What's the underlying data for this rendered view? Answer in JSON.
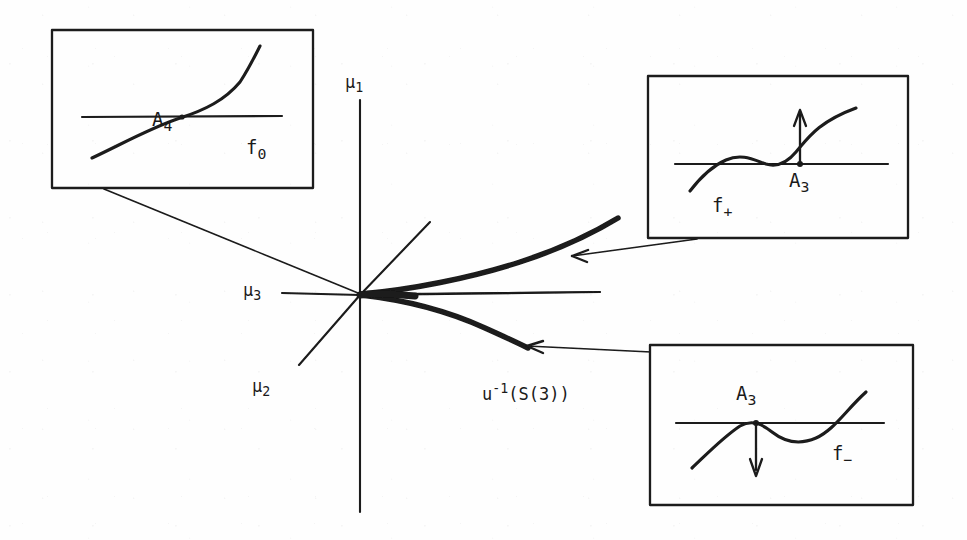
{
  "figure": {
    "kind": "bifurcation-diagram",
    "background_color": "#fefefe",
    "ink_color": "#1a1a1a"
  },
  "axes": {
    "origin": {
      "x": 360,
      "y": 295
    },
    "mu1": {
      "label_text": "μ",
      "label_sub": "1",
      "label_x": 348,
      "label_y": 78,
      "description": "vertical axis pointing up"
    },
    "mu2": {
      "label_text": "μ",
      "label_sub": "2",
      "label_x": 258,
      "label_y": 382,
      "description": "diagonal axis toward lower-left"
    },
    "mu3": {
      "label_text": "μ",
      "label_sub": "3",
      "label_x": 248,
      "label_y": 286,
      "description": "horizontal axis pointing left"
    }
  },
  "curve_label": {
    "base": "u",
    "exponent": "-1",
    "argument": "(S(3))",
    "full_text": "u⁻¹(S(3))",
    "x": 486,
    "y": 388
  },
  "insets": [
    {
      "name": "f-zero-inset",
      "label_text": "f",
      "label_sub": "0",
      "point_label_text": "A",
      "point_label_sub": "4",
      "box": {
        "x": 52,
        "y": 30,
        "w": 261,
        "h": 158
      },
      "label_pos": {
        "x": 250,
        "y": 145
      },
      "point_label_pos": {
        "x": 160,
        "y": 118
      },
      "curve_shape": "monotone-increasing-inflection",
      "arrow": "none"
    },
    {
      "name": "f-plus-inset",
      "label_text": "f",
      "label_sub": "+",
      "point_label_text": "A",
      "point_label_sub": "3",
      "box": {
        "x": 648,
        "y": 76,
        "w": 260,
        "h": 162
      },
      "label_pos": {
        "x": 718,
        "y": 200
      },
      "point_label_pos": {
        "x": 795,
        "y": 170
      },
      "curve_shape": "local-max-then-tangent-touch",
      "arrow": "up"
    },
    {
      "name": "f-minus-inset",
      "label_text": "f",
      "label_sub": "−",
      "point_label_text": "A",
      "point_label_sub": "3",
      "box": {
        "x": 650,
        "y": 345,
        "w": 263,
        "h": 160
      },
      "label_pos": {
        "x": 838,
        "y": 452
      },
      "point_label_pos": {
        "x": 742,
        "y": 408
      },
      "curve_shape": "tangent-touch-then-local-min",
      "arrow": "down"
    }
  ],
  "leaders": [
    {
      "name": "leader-f-zero",
      "from": {
        "x": 104,
        "y": 189
      },
      "to": {
        "x": 358,
        "y": 293
      }
    },
    {
      "name": "leader-f-plus",
      "from": {
        "x": 697,
        "y": 239
      },
      "to": {
        "x": 572,
        "y": 256
      }
    },
    {
      "name": "leader-f-minus",
      "from": {
        "x": 651,
        "y": 352
      },
      "to": {
        "x": 527,
        "y": 346
      }
    }
  ],
  "branches": [
    {
      "name": "upper-branch",
      "description": "thick curve from origin sweeping up-right"
    },
    {
      "name": "lower-branch",
      "description": "thick curve from origin sweeping down-right"
    },
    {
      "name": "middle-branch",
      "description": "thin horizontal segment between the two thick branches"
    }
  ]
}
